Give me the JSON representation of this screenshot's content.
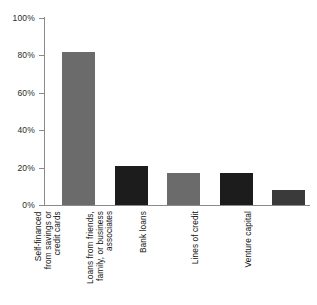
{
  "chart_data": {
    "type": "bar",
    "title": "",
    "subtitle": "",
    "xlabel": "",
    "ylabel": "",
    "categories": [
      "Self-financed\nfrom savings or\ncredit cards",
      "Loans from friends,\nfamily, or business\nassociates",
      "Bank loans",
      "Lines of credit",
      "Venture capital"
    ],
    "values": [
      82,
      21,
      17,
      17,
      8
    ],
    "ylim": [
      0,
      100
    ],
    "ytick_labels": [
      "0%",
      "20%",
      "40%",
      "60%",
      "80%",
      "100%"
    ],
    "ytick_values": [
      0,
      20,
      40,
      60,
      80,
      100
    ],
    "grid": false,
    "legend": "none",
    "bar_colors": [
      "#6b6b6b",
      "#1c1c1c",
      "#6b6b6b",
      "#1c1c1c",
      "#3a3a3a"
    ],
    "axis_color": "#8a8a8a",
    "background_color": "#ffffff"
  }
}
